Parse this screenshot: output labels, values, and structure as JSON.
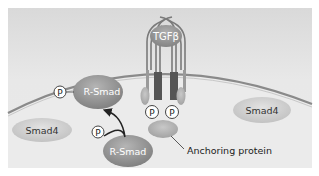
{
  "diagram": {
    "ligand": {
      "label": "TGFβ"
    },
    "receptor": {
      "phosphate_labels": [
        "P",
        "P"
      ]
    },
    "anchoring_protein": {
      "label": "Anchoring protein"
    },
    "r_smad_upper": {
      "label": "R-Smad",
      "phosphate": "P"
    },
    "r_smad_lower": {
      "label": "R-Smad"
    },
    "free_phosphate": {
      "label": "P"
    },
    "smad4_left": {
      "label": "Smad4"
    },
    "smad4_right": {
      "label": "Smad4"
    },
    "colors": {
      "background_panel": "#e4e4e4",
      "membrane": "#8a8a8a",
      "receptor_outline": "#7a7a7a",
      "receptor_dark": "#555555",
      "protein_dark": "#8c8c8c",
      "protein_light": "#cfcfcf"
    }
  }
}
